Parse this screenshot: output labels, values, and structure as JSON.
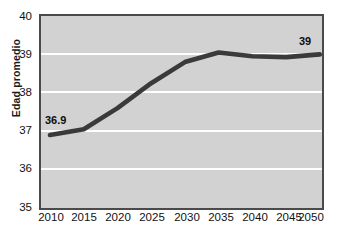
{
  "chart_data": {
    "type": "line",
    "title": "",
    "subtitle": "",
    "xlabel": "",
    "ylabel": "Edad promedio",
    "x": [
      "2010",
      "2015",
      "2020",
      "2025",
      "2030",
      "2035",
      "2040",
      "2045",
      "2050"
    ],
    "categories": [
      "2010",
      "2015",
      "2020",
      "2025",
      "2030",
      "2035",
      "2040",
      "2045",
      "2050"
    ],
    "values": [
      36.9,
      37.05,
      37.6,
      38.25,
      38.8,
      39.05,
      38.95,
      38.93,
      39.0
    ],
    "series": [
      {
        "name": "Edad promedio",
        "values": [
          36.9,
          37.05,
          37.6,
          38.25,
          38.8,
          39.05,
          38.95,
          38.93,
          39.0
        ]
      }
    ],
    "ylim": [
      35,
      40
    ],
    "y_ticks": [
      35,
      36,
      37,
      38,
      39,
      40
    ],
    "y_tick_labels": [
      "35",
      "36",
      "37",
      "38",
      "39",
      "40"
    ],
    "grid": "horizontal",
    "legend": "none",
    "annotations": [
      {
        "id": "start",
        "text": "36.9",
        "x": "2010",
        "y": 36.9
      },
      {
        "id": "end",
        "text": "39",
        "x": "2050",
        "y": 39.0
      }
    ],
    "colors": {
      "line": "#3a3a3a",
      "plot_background": "#d2d2d2",
      "gridline": "#ffffff",
      "border": "#4a4a4a",
      "text": "#111111",
      "page_background": "#ffffff"
    }
  }
}
